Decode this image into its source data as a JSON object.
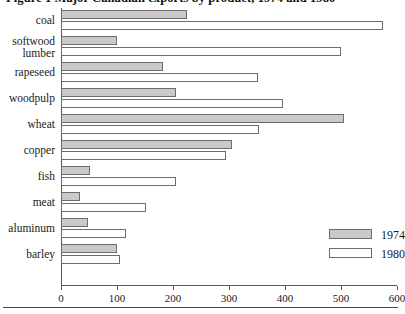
{
  "figure": {
    "title": "Figure 1   Major Canadian exports by product, 1974 and 1980"
  },
  "legend": {
    "position": "inside-right",
    "items": [
      {
        "label": "1974",
        "swatch": "shaded-swatch",
        "color": "#c9c9c9"
      },
      {
        "label": "1980",
        "swatch": "white-swatch",
        "color": "#ffffff"
      }
    ]
  },
  "axis": {
    "ticks": [
      "0",
      "100",
      "200",
      "300",
      "400",
      "500",
      "600"
    ]
  },
  "chart_data": {
    "type": "bar",
    "orientation": "horizontal",
    "title": "Figure 1   Major Canadian exports by product, 1974 and 1980",
    "xlabel": "",
    "ylabel": "",
    "xlim": [
      0,
      600
    ],
    "grid": false,
    "legend_position": "inside-right",
    "categories": [
      "coal",
      "softwood\nlumber",
      "rapeseed",
      "woodpulp",
      "wheat",
      "copper",
      "fish",
      "meat",
      "aluminum",
      "barley"
    ],
    "series": [
      {
        "name": "1974",
        "color": "#c9c9c9",
        "values": [
          225,
          100,
          182,
          205,
          505,
          305,
          52,
          34,
          49,
          100
        ]
      },
      {
        "name": "1980",
        "color": "#ffffff",
        "values": [
          575,
          500,
          352,
          396,
          354,
          295,
          205,
          152,
          116,
          106
        ]
      }
    ]
  }
}
